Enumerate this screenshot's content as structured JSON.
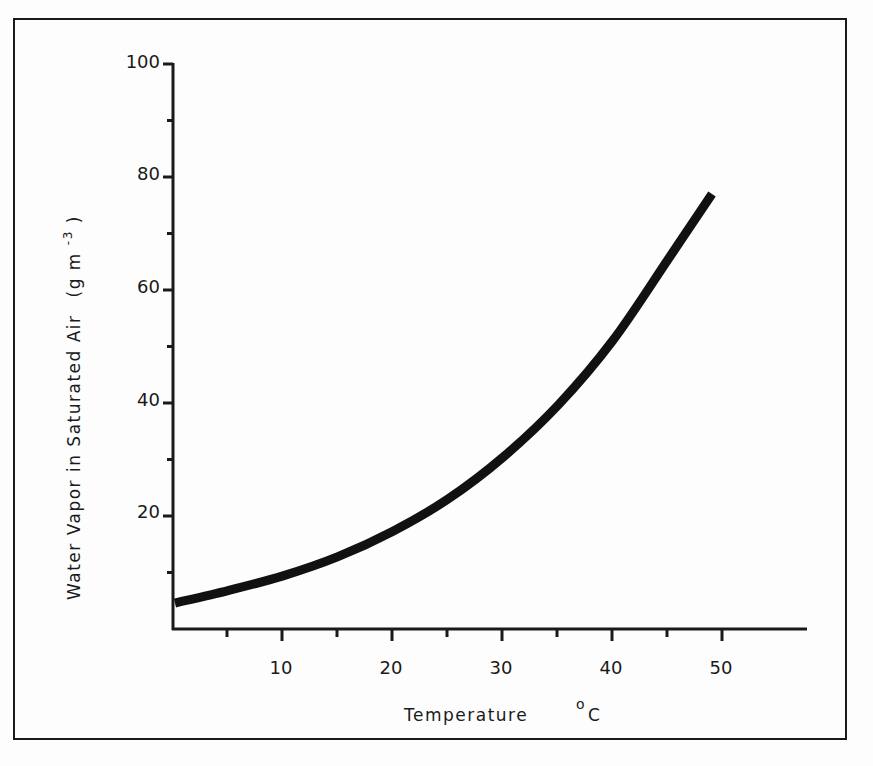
{
  "chart_data": {
    "type": "line",
    "title": "",
    "xlabel": "Temperature",
    "xlabel_unit": "°C",
    "ylabel": "Water Vapor in Saturated Air",
    "ylabel_unit": "(g m-3)",
    "xlim": [
      0,
      57
    ],
    "ylim": [
      0,
      100
    ],
    "x_ticks_major": [
      10,
      20,
      30,
      40,
      50
    ],
    "x_ticks_minor": [
      5,
      15,
      25,
      35,
      45
    ],
    "y_ticks_major": [
      20,
      40,
      60,
      80,
      100
    ],
    "y_ticks_minor": [
      10,
      30,
      50,
      70,
      90
    ],
    "grid": false,
    "legend": null,
    "series": [
      {
        "name": "Saturation vapor density",
        "x": [
          0,
          5,
          10,
          15,
          20,
          25,
          30,
          35,
          40,
          45,
          49
        ],
        "values": [
          4.6,
          6.8,
          9.4,
          12.8,
          17.3,
          23.0,
          30.4,
          39.6,
          51.1,
          65.4,
          77.0
        ]
      }
    ]
  },
  "labels": {
    "y_ticks": [
      "20",
      "40",
      "60",
      "80",
      "100"
    ],
    "x_ticks": [
      "10",
      "20",
      "30",
      "40",
      "50"
    ],
    "xlabel": "Temperature",
    "xlabel_degree": "o",
    "xlabel_unit": "C",
    "ylabel_main": "Water Vapor in Saturated Air",
    "ylabel_unit_open": "(g m",
    "ylabel_unit_sup": "-3",
    "ylabel_unit_close": ")"
  }
}
